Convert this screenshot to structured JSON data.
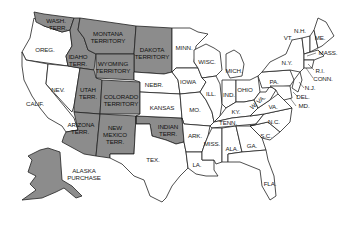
{
  "map": {
    "title_visible": false,
    "colors": {
      "territory_fill": "#8c8c8c",
      "state_fill": "#ffffff",
      "border": "#222222",
      "background": "#ffffff"
    },
    "legend": {
      "territory": "Territory (shaded)",
      "state": "State (white)"
    },
    "territories": [
      {
        "id": "wash",
        "line1": "WASH.",
        "line2": "TERR."
      },
      {
        "id": "idaho",
        "line1": "IDAHO",
        "line2": "TERR."
      },
      {
        "id": "montana",
        "line1": "MONTANA",
        "line2": "TERRITORY"
      },
      {
        "id": "dakota",
        "line1": "DAKOTA",
        "line2": "TERRITORY"
      },
      {
        "id": "wyoming",
        "line1": "WYOMING",
        "line2": "TERRITORY"
      },
      {
        "id": "utah",
        "line1": "UTAH",
        "line2": "TERR."
      },
      {
        "id": "colorado",
        "line1": "COLORADO",
        "line2": "TERRITORY"
      },
      {
        "id": "arizona",
        "line1": "ARIZONA",
        "line2": "TERR."
      },
      {
        "id": "newmexico",
        "line1": "NEW",
        "line2": "MEXICO",
        "line3": "TERR."
      },
      {
        "id": "indian",
        "line1": "INDIAN",
        "line2": "TERR."
      },
      {
        "id": "alaska",
        "line1": "ALASKA",
        "line2": "PURCHASE"
      }
    ],
    "states": {
      "oreg": "OREG.",
      "calif": "CALIF.",
      "nev": "NEV.",
      "nebr": "NEBR.",
      "kansas": "KANSAS",
      "tex": "TEX.",
      "minn": "MINN.",
      "iowa": "IOWA",
      "mo": "MO.",
      "ark": "ARK.",
      "la": "LA.",
      "wisc": "WISC.",
      "ill": "ILL.",
      "mich": "MICH.",
      "ind": "IND.",
      "ohio": "OHIO",
      "ky": "KY.",
      "tenn": "TENN.",
      "miss": "MISS.",
      "ala": "ALA.",
      "ga": "GA.",
      "fla": "FLA.",
      "sc": "S.C.",
      "nc": "N.C.",
      "va": "VA.",
      "wva": "W. VA.",
      "pa": "PA.",
      "ny": "N.Y.",
      "vt": "VT.",
      "nh": "N.H.",
      "me": "ME.",
      "mass": "MASS.",
      "ri": "R.I.",
      "conn": "CONN.",
      "nj": "N.J.",
      "del": "DEL.",
      "md": "MD."
    }
  }
}
